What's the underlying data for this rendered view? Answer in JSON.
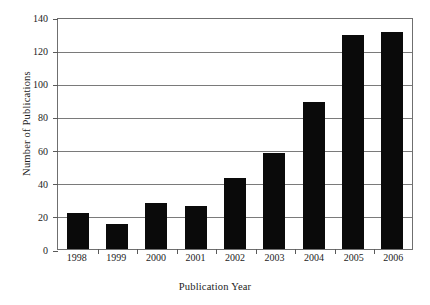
{
  "chart_data": {
    "type": "bar",
    "title": "",
    "xlabel": "Publication Year",
    "ylabel": "Number of Publications",
    "categories": [
      "1998",
      "1999",
      "2000",
      "2001",
      "2002",
      "2003",
      "2004",
      "2005",
      "2006"
    ],
    "values": [
      22,
      15,
      28,
      26,
      43,
      58,
      89,
      129,
      131
    ],
    "ylim": [
      0,
      140
    ],
    "yticks": [
      0,
      20,
      40,
      60,
      80,
      100,
      120,
      140
    ],
    "ytick_labels": [
      "0",
      "20",
      "40",
      "60",
      "80",
      "100",
      "120",
      "140"
    ],
    "grid": "horizontal",
    "legend": "none",
    "bar_color": "#0a0a0a",
    "grid_color": "#7a7a7a",
    "frame_color": "#6f6f6f",
    "text_color": "#1c1c1c"
  }
}
